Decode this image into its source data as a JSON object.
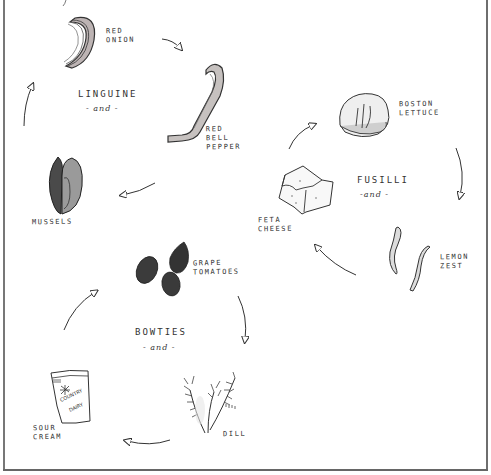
{
  "recipes": [
    {
      "pasta": "LINGUINE",
      "connector": "- and -",
      "ingredients": [
        {
          "name": "RED\nONION",
          "icon": "red-onion-slice-icon"
        },
        {
          "name": "RED\nBELL\nPEPPER",
          "icon": "red-bell-pepper-strip-icon"
        },
        {
          "name": "MUSSELS",
          "icon": "mussel-shell-icon"
        }
      ]
    },
    {
      "pasta": "FUSILLI",
      "connector": "-and -",
      "ingredients": [
        {
          "name": "BOSTON\nLETTUCE",
          "icon": "lettuce-leaf-icon"
        },
        {
          "name": "LEMON\nZEST",
          "icon": "lemon-zest-icon"
        },
        {
          "name": "FETA\nCHEESE",
          "icon": "feta-cheese-block-icon"
        }
      ]
    },
    {
      "pasta": "BOWTIES",
      "connector": "- and -",
      "ingredients": [
        {
          "name": "GRAPE\nTOMATOES",
          "icon": "grape-tomatoes-icon"
        },
        {
          "name": "DILL",
          "icon": "dill-sprig-icon"
        },
        {
          "name": "SOUR\nCREAM",
          "icon": "sour-cream-tub-icon"
        }
      ]
    }
  ],
  "sour_cream_label_text": "COUNTRY\nDAIRY",
  "colors": {
    "ink": "#2a2a2a",
    "frame": "#707070",
    "background": "#ffffff",
    "tomato": "#3a3a3a",
    "mussel": "#4a4a4a"
  }
}
